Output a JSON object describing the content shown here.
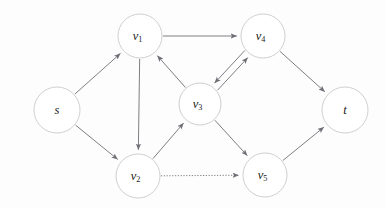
{
  "figure": {
    "kind": "directed-graph",
    "background_color": "#fdfdfd",
    "node_fill": "#ffffff",
    "node_stroke": "#c9c9cc",
    "edge_color": "#7e7e84",
    "label_color": "#1b1b1b"
  },
  "nodes": [
    {
      "id": "s",
      "label": "s",
      "sub": "",
      "cx": 57,
      "cy": 110,
      "r": 23
    },
    {
      "id": "v1",
      "label": "v",
      "sub": "1",
      "cx": 140,
      "cy": 36,
      "r": 22
    },
    {
      "id": "v2",
      "label": "v",
      "sub": "2",
      "cx": 138,
      "cy": 176,
      "r": 22
    },
    {
      "id": "v3",
      "label": "v",
      "sub": "3",
      "cx": 200,
      "cy": 104,
      "r": 21
    },
    {
      "id": "v4",
      "label": "v",
      "sub": "4",
      "cx": 263,
      "cy": 36,
      "r": 22
    },
    {
      "id": "v5",
      "label": "v",
      "sub": "5",
      "cx": 265,
      "cy": 175,
      "r": 22
    },
    {
      "id": "t",
      "label": "t",
      "sub": "",
      "cx": 345,
      "cy": 110,
      "r": 23
    }
  ],
  "edges": [
    {
      "id": "s-v1",
      "from": "s",
      "to": "v1",
      "style": "solid",
      "offset": 0,
      "arrow": "end"
    },
    {
      "id": "s-v2",
      "from": "s",
      "to": "v2",
      "style": "solid",
      "offset": 0,
      "arrow": "end"
    },
    {
      "id": "v1-v4",
      "from": "v1",
      "to": "v4",
      "style": "solid",
      "offset": 0,
      "arrow": "end"
    },
    {
      "id": "v1-v2",
      "from": "v1",
      "to": "v2",
      "style": "solid",
      "offset": 0,
      "arrow": "end"
    },
    {
      "id": "v3-v1",
      "from": "v3",
      "to": "v1",
      "style": "solid",
      "offset": 0,
      "arrow": "end"
    },
    {
      "id": "v2-v3",
      "from": "v2",
      "to": "v3",
      "style": "solid",
      "offset": 0,
      "arrow": "end"
    },
    {
      "id": "v3-v4",
      "from": "v3",
      "to": "v4",
      "style": "solid",
      "offset": 3.5,
      "arrow": "end"
    },
    {
      "id": "v4-v3",
      "from": "v4",
      "to": "v3",
      "style": "solid",
      "offset": 3.5,
      "arrow": "end"
    },
    {
      "id": "v3-v5",
      "from": "v3",
      "to": "v5",
      "style": "solid",
      "offset": 0,
      "arrow": "end"
    },
    {
      "id": "v2-v5",
      "from": "v2",
      "to": "v5",
      "style": "dotted",
      "offset": 0,
      "arrow": "end"
    },
    {
      "id": "v4-t",
      "from": "v4",
      "to": "t",
      "style": "solid",
      "offset": 0,
      "arrow": "end"
    },
    {
      "id": "v5-t",
      "from": "v5",
      "to": "t",
      "style": "solid",
      "offset": 0,
      "arrow": "end"
    }
  ]
}
